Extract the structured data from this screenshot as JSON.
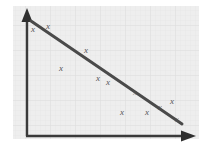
{
  "figure": {
    "title": "",
    "caption": "",
    "background_color": "#ffffff",
    "plot_background_color": "#eeeeee",
    "grid_line_color": "#e3e3e3",
    "axis_color": "#3a3a3a",
    "trendline_color": "#4a4a4a",
    "marker_color": "#555555",
    "marker_glyph": "x"
  },
  "axes": {
    "x_axis_label": "",
    "y_axis_label": "",
    "x_tick_labels": [],
    "y_tick_labels": [],
    "has_x_arrowhead": true,
    "has_y_arrowhead": true,
    "origin_x": 27,
    "origin_y": 136
  },
  "chart_data": {
    "type": "scatter",
    "title": "",
    "subtitle": "",
    "xlabel": "",
    "ylabel": "",
    "xlim": [
      0,
      100
    ],
    "ylim": [
      0,
      100
    ],
    "grid": true,
    "legend": null,
    "legend_position": "none",
    "annotations": [],
    "correlation": "negative",
    "series": [
      {
        "name": "observations",
        "marker": "x",
        "x": [
          4,
          13,
          21,
          36,
          44,
          51,
          59,
          68,
          74,
          85,
          91,
          95
        ],
        "y": [
          93,
          96,
          69,
          83,
          57,
          52,
          42,
          24,
          24,
          30,
          26,
          18
        ]
      },
      {
        "name": "trend-line",
        "type": "line",
        "x": [
          3,
          97
        ],
        "y": [
          98,
          12
        ]
      }
    ],
    "points_pixel": [
      {
        "x": 33,
        "y": 29
      },
      {
        "x": 48,
        "y": 26
      },
      {
        "x": 61,
        "y": 68
      },
      {
        "x": 86,
        "y": 50
      },
      {
        "x": 98,
        "y": 78
      },
      {
        "x": 108,
        "y": 82
      },
      {
        "x": 122,
        "y": 112
      },
      {
        "x": 135,
        "y": 92
      },
      {
        "x": 147,
        "y": 112
      },
      {
        "x": 160,
        "y": 107
      },
      {
        "x": 172,
        "y": 101
      },
      {
        "x": 177,
        "y": 119
      }
    ],
    "trendline_pixel": {
      "x1": 31,
      "y1": 21,
      "x2": 182,
      "y2": 124
    }
  }
}
